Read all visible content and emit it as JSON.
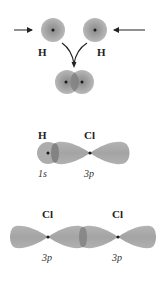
{
  "panels": {
    "h2_formation": {
      "atom_left_label": "H",
      "atom_right_label": "H"
    },
    "hcl_bond": {
      "atom_left_label": "H",
      "atom_right_label": "Cl",
      "orbital_left_label": "1s",
      "orbital_right_label": "3p"
    },
    "cl2_bond": {
      "atom_left_label": "Cl",
      "atom_right_label": "Cl",
      "orbital_left_label": "3p",
      "orbital_right_label": "3p"
    }
  },
  "colors": {
    "orbital_fill": "#a8a8a8",
    "orbital_dark": "#8c8c8c",
    "overlap": "#7d7d7d",
    "nucleus": "#1a1a1a",
    "arrow": "#222222"
  }
}
